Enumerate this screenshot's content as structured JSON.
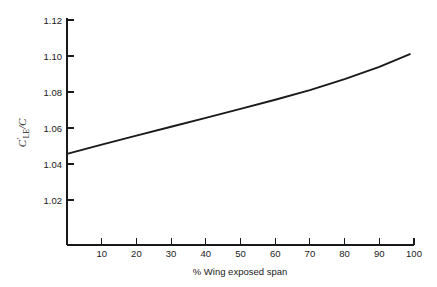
{
  "chart_data": {
    "type": "line",
    "title": "",
    "subtitle": "",
    "xlabel": "% Wing exposed span",
    "ylabel": "C'LE/C",
    "ylabel_parts": {
      "symbol": "C",
      "prime": "′",
      "subscript": "LE",
      "divider": "/",
      "denominator": "C"
    },
    "xlim": [
      0,
      100
    ],
    "ylim": [
      1.01,
      1.125
    ],
    "grid": false,
    "legend": null,
    "legend_position": "none",
    "xticks": [
      0,
      10,
      20,
      30,
      40,
      50,
      60,
      70,
      80,
      90,
      100
    ],
    "xtick_labels": [
      "",
      "10",
      "20",
      "30",
      "40",
      "50",
      "60",
      "70",
      "80",
      "90",
      "100"
    ],
    "yticks": [
      1.02,
      1.04,
      1.06,
      1.08,
      1.1,
      1.12
    ],
    "ytick_labels": [
      "1.02",
      "1.04",
      "1.06",
      "1.08",
      "1.10",
      "1.12"
    ],
    "series": [
      {
        "name": "CLE ratio",
        "color": "#1a1a1a",
        "x": [
          0,
          10,
          20,
          30,
          40,
          50,
          60,
          70,
          80,
          90,
          99
        ],
        "values": [
          1.0456,
          1.0508,
          1.0558,
          1.0607,
          1.0656,
          1.0706,
          1.0757,
          1.081,
          1.0872,
          1.094,
          1.1012
        ]
      }
    ],
    "annotations": []
  },
  "axis": {
    "y_tick_values": [
      "1.12",
      "1.10",
      "1.08",
      "1.06",
      "1.04",
      "1.02"
    ],
    "x_tick_values": [
      "10",
      "20",
      "30",
      "40",
      "50",
      "60",
      "70",
      "80",
      "90",
      "100"
    ],
    "x_title": "% Wing exposed span"
  }
}
